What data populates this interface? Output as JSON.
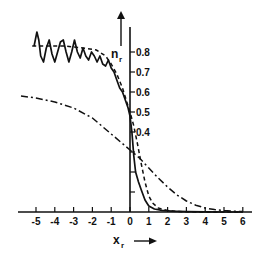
{
  "chart_data": {
    "type": "line",
    "title": "",
    "xlabel": "x",
    "xlabel_sub": "r",
    "ylabel": "n",
    "ylabel_sub": "r",
    "xlim": [
      -5.5,
      6.3
    ],
    "ylim": [
      0,
      0.92
    ],
    "x_ticks": [
      -5,
      -4,
      -3,
      -2,
      -1,
      0,
      1,
      2,
      3,
      4,
      5,
      6
    ],
    "x_tick_labels": [
      "-5",
      "-4",
      "-3",
      "-2",
      "-1",
      "0",
      "1",
      "2",
      "3",
      "4",
      "5",
      "6"
    ],
    "y_ticks": [
      0.1,
      0.2,
      0.3,
      0.4,
      0.5,
      0.6,
      0.7,
      0.8
    ],
    "y_tick_labels": [
      "",
      "",
      "",
      "0.4",
      "0.5",
      "0.6",
      "0.7",
      "0.8"
    ],
    "grid": false,
    "legend": "none",
    "series": [
      {
        "name": "solid",
        "style": "solid",
        "x": [
          -5.1,
          -4.95,
          -4.85,
          -4.75,
          -4.6,
          -4.45,
          -4.3,
          -4.15,
          -4.0,
          -3.85,
          -3.7,
          -3.55,
          -3.4,
          -3.25,
          -3.1,
          -2.95,
          -2.8,
          -2.65,
          -2.5,
          -2.35,
          -2.2,
          -2.05,
          -1.9,
          -1.75,
          -1.6,
          -1.45,
          -1.3,
          -1.15,
          -1.0,
          -0.85,
          -0.7,
          -0.55,
          -0.4,
          -0.25,
          -0.1,
          0.0,
          0.1,
          0.2,
          0.3,
          0.45,
          0.6,
          0.8,
          1.0,
          1.3,
          1.7,
          2.2,
          3.0,
          4.0,
          5.0,
          6.0
        ],
        "y": [
          0.83,
          0.9,
          0.86,
          0.78,
          0.75,
          0.82,
          0.86,
          0.79,
          0.75,
          0.8,
          0.85,
          0.86,
          0.8,
          0.75,
          0.8,
          0.86,
          0.8,
          0.77,
          0.82,
          0.78,
          0.76,
          0.8,
          0.78,
          0.75,
          0.78,
          0.74,
          0.73,
          0.76,
          0.72,
          0.7,
          0.66,
          0.62,
          0.6,
          0.56,
          0.52,
          0.48,
          0.4,
          0.28,
          0.2,
          0.15,
          0.11,
          0.06,
          0.03,
          0.015,
          0.008,
          0.004,
          0.002,
          0.001,
          0.0,
          0.0
        ]
      },
      {
        "name": "dashed",
        "style": "dashed",
        "x": [
          -5.2,
          -4.5,
          -3.5,
          -2.5,
          -1.8,
          -1.3,
          -1.0,
          -0.7,
          -0.4,
          -0.2,
          0.0,
          0.2,
          0.4,
          0.6,
          0.8,
          1.0,
          1.2,
          1.5,
          2.0,
          2.5,
          3.0,
          4.0,
          5.0,
          6.0
        ],
        "y": [
          0.83,
          0.83,
          0.83,
          0.82,
          0.81,
          0.78,
          0.74,
          0.69,
          0.62,
          0.56,
          0.5,
          0.43,
          0.34,
          0.24,
          0.15,
          0.08,
          0.045,
          0.02,
          0.008,
          0.003,
          0.001,
          0.0,
          0.0,
          0.0
        ]
      },
      {
        "name": "dash-dot",
        "style": "dash-dot",
        "x": [
          -5.8,
          -5.0,
          -4.0,
          -3.0,
          -2.0,
          -1.5,
          -1.0,
          -0.5,
          0.0,
          0.5,
          1.0,
          1.5,
          2.0,
          2.5,
          3.0,
          3.5,
          4.0,
          4.5,
          5.0,
          5.5,
          6.0
        ],
        "y": [
          0.58,
          0.57,
          0.55,
          0.52,
          0.47,
          0.43,
          0.39,
          0.35,
          0.31,
          0.27,
          0.22,
          0.17,
          0.125,
          0.085,
          0.055,
          0.034,
          0.02,
          0.012,
          0.007,
          0.004,
          0.002
        ]
      }
    ]
  }
}
